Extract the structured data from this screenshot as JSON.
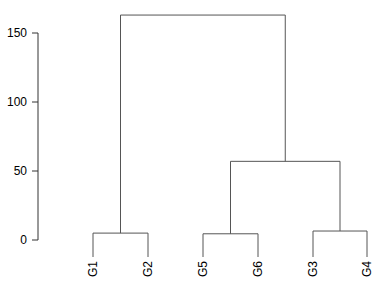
{
  "chart_data": {
    "type": "dendrogram",
    "title": "",
    "xlabel": "",
    "ylabel": "",
    "ylim": [
      0,
      165
    ],
    "yticks": [
      0,
      50,
      100,
      150
    ],
    "leaves": [
      "G1",
      "G2",
      "G5",
      "G6",
      "G3",
      "G4"
    ],
    "merges": [
      {
        "left": "G1",
        "right": "G2",
        "height": 5
      },
      {
        "left": "G5",
        "right": "G6",
        "height": 4.5
      },
      {
        "left": "G3",
        "right": "G4",
        "height": 6.5
      },
      {
        "left": "(G5,G6)",
        "right": "(G3,G4)",
        "height": 57
      },
      {
        "left": "(G1,G2)",
        "right": "((G5,G6),(G3,G4))",
        "height": 163
      }
    ],
    "grid": false,
    "line_color": "#555555"
  }
}
